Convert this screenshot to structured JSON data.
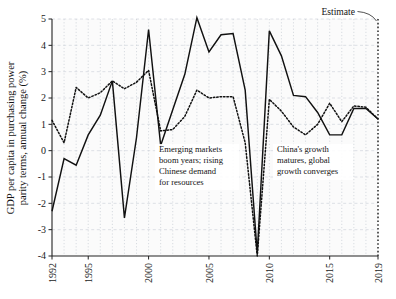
{
  "chart_data": {
    "type": "line",
    "title": "",
    "xlabel": "",
    "ylabel": "GDP per capita in purchasing power parity terms, annual change (%)",
    "ylabel_line1": "GDP per capita in purchasing power",
    "ylabel_line2": "parity terms, annual change (%)",
    "xlim": [
      1992,
      2019
    ],
    "ylim": [
      -4,
      5
    ],
    "ytick_labels": [
      "5",
      "4",
      "3",
      "2",
      "1",
      "0",
      "-1",
      "-2",
      "-3",
      "-4"
    ],
    "ytick_values": [
      5,
      4,
      3,
      2,
      1,
      0,
      -1,
      -2,
      -3,
      -4
    ],
    "xtick_labels": [
      "1992",
      "1995",
      "2000",
      "2005",
      "2010",
      "2015",
      "2019"
    ],
    "xtick_values": [
      1992,
      1995,
      2000,
      2005,
      2010,
      2015,
      2019
    ],
    "grid": true,
    "legend_position": "none",
    "x": [
      1992,
      1993,
      1994,
      1995,
      1996,
      1997,
      1998,
      1999,
      2000,
      2001,
      2002,
      2003,
      2004,
      2005,
      2006,
      2007,
      2008,
      2009,
      2010,
      2011,
      2012,
      2013,
      2014,
      2015,
      2016,
      2017,
      2018,
      2019
    ],
    "series": [
      {
        "name": "Emerging and developing economies",
        "style": "solid",
        "color": "#111111",
        "values": [
          -2.3,
          -0.3,
          -0.55,
          0.6,
          1.35,
          2.65,
          -2.55,
          0.5,
          4.6,
          0.2,
          1.55,
          2.9,
          5.05,
          3.75,
          4.4,
          4.45,
          2.3,
          -3.9,
          4.55,
          3.6,
          2.1,
          2.05,
          1.45,
          0.6,
          0.6,
          1.6,
          1.6,
          1.2
        ]
      },
      {
        "name": "World",
        "style": "dotted",
        "color": "#111111",
        "values": [
          1.15,
          0.3,
          2.4,
          2.0,
          2.2,
          2.65,
          2.35,
          2.6,
          3.05,
          0.75,
          0.8,
          1.3,
          2.3,
          2.0,
          2.05,
          2.05,
          0.3,
          -4.35,
          1.95,
          1.5,
          0.9,
          0.6,
          1.0,
          1.8,
          1.1,
          1.7,
          1.65,
          1.2
        ]
      }
    ],
    "annotations": [
      {
        "name": "emerging-markets-note",
        "lines": [
          "Emerging markets",
          "boom years; rising",
          "Chinese demand",
          "for resources"
        ],
        "x": 159,
        "y": 152
      },
      {
        "name": "china-growth-note",
        "lines": [
          "China's growth",
          "matures, global",
          "growth converges"
        ],
        "x": 277,
        "y": 152
      }
    ],
    "estimate_label": "Estimate",
    "estimate_line_x": 2019
  }
}
